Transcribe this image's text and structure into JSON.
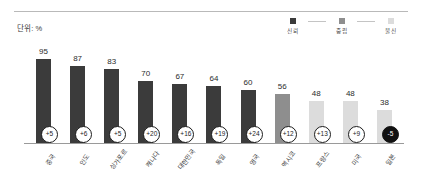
{
  "header": {
    "unit_label": "단위: %"
  },
  "legend": {
    "items": [
      {
        "label": "신뢰",
        "color": "#3b3b3b"
      },
      {
        "label": "중립",
        "color": "#8e8e8e"
      },
      {
        "label": "불신",
        "color": "#d8d8d8"
      }
    ]
  },
  "chart_data": {
    "type": "bar",
    "title": "",
    "subtitle": "",
    "xlabel": "",
    "ylabel": "",
    "unit": "%",
    "ylim": [
      0,
      100
    ],
    "grid": false,
    "legend_position": "top-right",
    "categories": [
      "중국",
      "인도",
      "싱가포르",
      "캐나다",
      "대한민국",
      "독일",
      "영국",
      "멕시코",
      "프랑스",
      "미국",
      "일본"
    ],
    "values": [
      95,
      87,
      83,
      70,
      67,
      64,
      60,
      56,
      48,
      48,
      38
    ],
    "bar_colors": [
      "#3b3b3b",
      "#3b3b3b",
      "#3b3b3b",
      "#3b3b3b",
      "#3b3b3b",
      "#3b3b3b",
      "#3b3b3b",
      "#8e8e8e",
      "#dcdcdc",
      "#dcdcdc",
      "#dcdcdc"
    ],
    "annotations": {
      "name": "change-badges",
      "values": [
        "+5",
        "+6",
        "+5",
        "+20",
        "+16",
        "+19",
        "+24",
        "+12",
        "+13",
        "+9",
        "-5"
      ],
      "negative_flags": [
        false,
        false,
        false,
        false,
        false,
        false,
        false,
        false,
        false,
        false,
        true
      ]
    },
    "series": [
      {
        "name": "신뢰",
        "values": [
          95,
          87,
          83,
          70,
          67,
          64,
          60,
          56,
          48,
          48,
          38
        ]
      }
    ]
  }
}
